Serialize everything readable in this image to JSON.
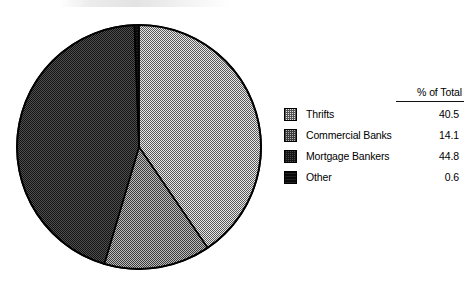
{
  "chart_data": {
    "type": "pie",
    "title": "",
    "categories": [
      "Thrifts",
      "Commercial Banks",
      "Mortgage Bankers",
      "Other"
    ],
    "values": [
      40.5,
      14.1,
      44.8,
      0.6
    ],
    "value_unit": "%",
    "value_column_header": "% of Total",
    "legend_position": "right",
    "grid": false,
    "start_angle_deg": 0,
    "slice_order_clockwise_from_top": [
      "Thrifts",
      "Commercial Banks",
      "Mortgage Bankers",
      "Other"
    ],
    "slices": [
      {
        "label": "Thrifts",
        "value": 40.5,
        "fill": "dither-light",
        "color": "#cfcfcf"
      },
      {
        "label": "Commercial Banks",
        "value": 14.1,
        "fill": "dither-medium",
        "color": "#9a9a9a"
      },
      {
        "label": "Mortgage Bankers",
        "value": 44.8,
        "fill": "dither-dark",
        "color": "#454545"
      },
      {
        "label": "Other",
        "value": 0.6,
        "fill": "dither-solid",
        "color": "#0a0a0a"
      }
    ]
  },
  "legend": {
    "header": "% of Total",
    "rows": [
      {
        "label": "Thrifts",
        "value": "40.5",
        "swatch": "swatch-thrifts"
      },
      {
        "label": "Commercial Banks",
        "value": "14.1",
        "swatch": "swatch-commercial-banks"
      },
      {
        "label": "Mortgage Bankers",
        "value": "44.8",
        "swatch": "swatch-mortgage-bankers"
      },
      {
        "label": "Other",
        "value": "0.6",
        "swatch": "swatch-other"
      }
    ]
  },
  "colors": {
    "outline": "#000000",
    "background": "#ffffff",
    "text": "#000000"
  }
}
